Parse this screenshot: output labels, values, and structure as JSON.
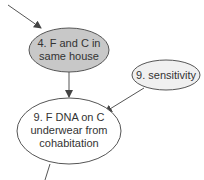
{
  "diagram": {
    "nodes": [
      {
        "id": "n4",
        "lines": [
          "4. F and C in",
          "same house"
        ],
        "fill": "#c8c8c8"
      },
      {
        "id": "n9s",
        "lines": [
          "9. sensitivity"
        ],
        "fill": "#f0f0f0"
      },
      {
        "id": "n9",
        "lines": [
          "9. F DNA on C",
          "underwear from",
          "cohabitation"
        ],
        "fill": "#ffffff"
      }
    ],
    "edges": [
      {
        "from": "offscreen-top-left",
        "to": "n4"
      },
      {
        "from": "n4",
        "to": "n9"
      },
      {
        "from": "n9s",
        "to": "n9"
      },
      {
        "from": "n9",
        "to": "offscreen-bottom"
      }
    ],
    "colors": {
      "stroke": "#555555",
      "text": "#333333"
    }
  }
}
